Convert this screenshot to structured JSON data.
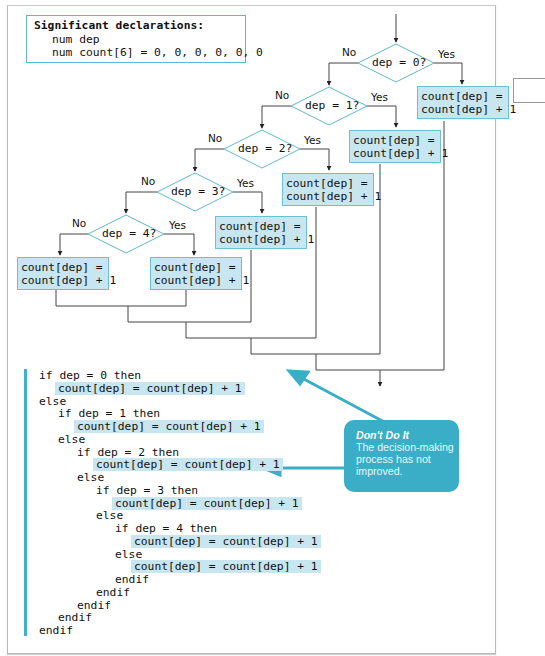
{
  "declarations": {
    "heading": "Significant declarations:",
    "lines": [
      "num dep",
      "num count[6] = 0, 0, 0, 0, 0, 0"
    ]
  },
  "flowchart": {
    "decisions": [
      {
        "label": "dep = 0?",
        "no": "No",
        "yes": "Yes"
      },
      {
        "label": "dep = 1?",
        "no": "No",
        "yes": "Yes"
      },
      {
        "label": "dep = 2?",
        "no": "No",
        "yes": "Yes"
      },
      {
        "label": "dep = 3?",
        "no": "No",
        "yes": "Yes"
      },
      {
        "label": "dep = 4?",
        "no": "No",
        "yes": "Yes"
      }
    ],
    "process_boxes": [
      {
        "id": "yes0",
        "text": "count[dep] =\ncount[dep] + 1"
      },
      {
        "id": "yes1",
        "text": "count[dep] =\ncount[dep] + 1"
      },
      {
        "id": "yes2",
        "text": "count[dep] =\ncount[dep] + 1"
      },
      {
        "id": "yes3",
        "text": "count[dep] =\ncount[dep] + 1"
      },
      {
        "id": "yes4",
        "text": "count[dep] =\ncount[dep] + 1"
      },
      {
        "id": "no4",
        "text": "count[dep] =\ncount[dep] + 1"
      }
    ]
  },
  "pseudocode": [
    {
      "indent": 0,
      "text": "if dep = 0 then",
      "highlight": false
    },
    {
      "indent": 1,
      "text": "count[dep] = count[dep] + 1",
      "highlight": true
    },
    {
      "indent": 0,
      "text": "else",
      "highlight": false
    },
    {
      "indent": 1,
      "text": "if dep = 1 then",
      "highlight": false
    },
    {
      "indent": 2,
      "text": "count[dep] = count[dep] + 1",
      "highlight": true
    },
    {
      "indent": 1,
      "text": "else",
      "highlight": false
    },
    {
      "indent": 2,
      "text": "if dep = 2 then",
      "highlight": false
    },
    {
      "indent": 3,
      "text": "count[dep] = count[dep] + 1",
      "highlight": true
    },
    {
      "indent": 2,
      "text": "else",
      "highlight": false
    },
    {
      "indent": 3,
      "text": "if dep = 3 then",
      "highlight": false
    },
    {
      "indent": 4,
      "text": "count[dep] = count[dep] + 1",
      "highlight": true
    },
    {
      "indent": 3,
      "text": "else",
      "highlight": false
    },
    {
      "indent": 4,
      "text": "if dep = 4 then",
      "highlight": false
    },
    {
      "indent": 5,
      "text": "count[dep] = count[dep] + 1",
      "highlight": true
    },
    {
      "indent": 4,
      "text": "else",
      "highlight": false
    },
    {
      "indent": 5,
      "text": "count[dep] = count[dep] + 1",
      "highlight": true
    },
    {
      "indent": 4,
      "text": "endif",
      "highlight": false
    },
    {
      "indent": 3,
      "text": "endif",
      "highlight": false
    },
    {
      "indent": 2,
      "text": "endif",
      "highlight": false
    },
    {
      "indent": 1,
      "text": "endif",
      "highlight": false
    },
    {
      "indent": 0,
      "text": "endif",
      "highlight": false
    }
  ],
  "callout": {
    "title": "Don't Do It",
    "body": "The decision-making process has not improved."
  },
  "colors": {
    "accent": "#3aaec6",
    "box_fill": "#c7e6ef",
    "box_border": "#6cc0d2",
    "line": "#333333"
  }
}
